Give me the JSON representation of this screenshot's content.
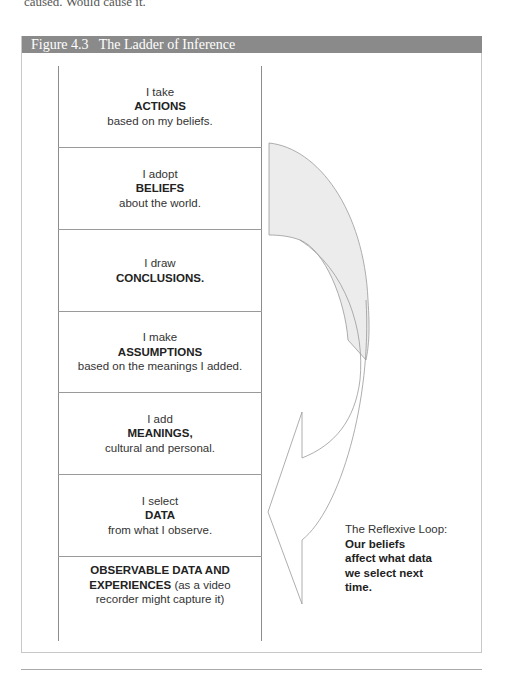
{
  "page": {
    "cut_text": "caused. Would cause it."
  },
  "figure": {
    "title": "Figure 4.3   The Ladder of Inference",
    "header_color": "#8a8a8a"
  },
  "ladder": {
    "steps": [
      {
        "pre": "I take",
        "bold": "ACTIONS",
        "post": "based on my beliefs."
      },
      {
        "pre": "I adopt",
        "bold": "BELIEFS",
        "post": "about the world."
      },
      {
        "pre": "I draw",
        "bold": "CONCLUSIONS.",
        "post": ""
      },
      {
        "pre": "I make",
        "bold": "ASSUMPTIONS",
        "post": "based on the meanings I added."
      },
      {
        "pre": "I add",
        "bold": "MEANINGS,",
        "post": "cultural and personal."
      },
      {
        "pre": "I select",
        "bold": "DATA",
        "post": "from what I observe."
      },
      {
        "pre": "",
        "bold": "OBSERVABLE DATA AND EXPERIENCES",
        "post": "(as a video recorder might capture it)"
      }
    ]
  },
  "reflexive_loop": {
    "label": "The Reflexive Loop:",
    "bold_lines": [
      "Our beliefs",
      "affect what data",
      "we select next",
      "time."
    ],
    "arrow_fill": "#ececec",
    "arrow_stroke": "#999999"
  }
}
